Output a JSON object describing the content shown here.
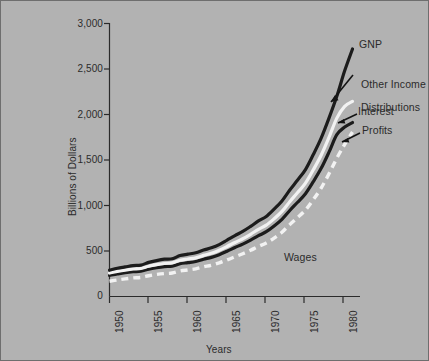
{
  "chart_data": {
    "type": "line",
    "title": "",
    "xlabel": "Years",
    "ylabel": "Billions of Dollars",
    "xlim": [
      1950,
      1981
    ],
    "ylim": [
      0,
      3000
    ],
    "grid": false,
    "legend_position": "inline-annotations",
    "xticklabels": [
      "1950",
      "1955",
      "1960",
      "1965",
      "1970",
      "1975",
      "1980"
    ],
    "xticks": [
      1950,
      1955,
      1960,
      1965,
      1970,
      1975,
      1980
    ],
    "yticklabels": [
      "0",
      "500",
      "1,000",
      "1,500",
      "2,000",
      "2,500",
      "3,000"
    ],
    "yticks": [
      0,
      500,
      1000,
      1500,
      2000,
      2500,
      3000
    ],
    "x": [
      1950,
      1951,
      1952,
      1953,
      1954,
      1955,
      1956,
      1957,
      1958,
      1959,
      1960,
      1961,
      1962,
      1963,
      1964,
      1965,
      1966,
      1967,
      1968,
      1969,
      1970,
      1971,
      1972,
      1973,
      1974,
      1975,
      1976,
      1977,
      1978,
      1979,
      1980,
      1981
    ],
    "series": [
      {
        "name": "GNP",
        "color": "#1c1c1c",
        "style": "solid",
        "values": [
          290,
          310,
          325,
          340,
          345,
          375,
          395,
          410,
          415,
          450,
          465,
          480,
          510,
          535,
          570,
          620,
          670,
          715,
          770,
          830,
          880,
          960,
          1050,
          1170,
          1280,
          1395,
          1560,
          1740,
          1960,
          2200,
          2480,
          2720
        ]
      },
      {
        "name": "Other Income Distributions",
        "color": "#f2f2f2",
        "style": "solid",
        "values": [
          258,
          275,
          290,
          302,
          308,
          332,
          350,
          363,
          370,
          398,
          412,
          425,
          452,
          475,
          508,
          550,
          594,
          635,
          684,
          738,
          784,
          854,
          935,
          1042,
          1142,
          1246,
          1392,
          1552,
          1748,
          1960,
          2090,
          2145
        ]
      },
      {
        "name": "Interest",
        "color": "#1c1c1c",
        "style": "solid",
        "values": [
          232,
          248,
          262,
          272,
          278,
          300,
          316,
          328,
          334,
          360,
          372,
          385,
          410,
          430,
          460,
          498,
          538,
          576,
          620,
          668,
          712,
          775,
          848,
          945,
          1036,
          1130,
          1262,
          1408,
          1586,
          1778,
          1862,
          1912
        ]
      },
      {
        "name": "Profits",
        "color": "#f2f2f2",
        "style": "dashed",
        "values": [
          168,
          182,
          194,
          204,
          210,
          228,
          242,
          252,
          258,
          280,
          292,
          304,
          326,
          344,
          370,
          402,
          436,
          470,
          508,
          550,
          588,
          642,
          706,
          790,
          868,
          950,
          1064,
          1192,
          1348,
          1520,
          1672,
          1808
        ]
      }
    ],
    "annotations": [
      {
        "id": "gnp",
        "text": "GNP",
        "arrow": false
      },
      {
        "id": "other-income",
        "text": "Other Income\nDistributions",
        "line1": "Other Income",
        "line2": "Distributions",
        "arrow": true
      },
      {
        "id": "interest",
        "text": "Interest",
        "arrow": true
      },
      {
        "id": "profits",
        "text": "Profits",
        "arrow": true
      },
      {
        "id": "wages",
        "text": "Wages",
        "arrow": false
      }
    ]
  },
  "colors": {
    "background": "#b2b2b2",
    "axis": "#2b2b2b",
    "dark_series": "#1c1c1c",
    "light_series": "#f2f2f2",
    "text": "#2b2b2b",
    "frame": "#6e6e6e"
  }
}
